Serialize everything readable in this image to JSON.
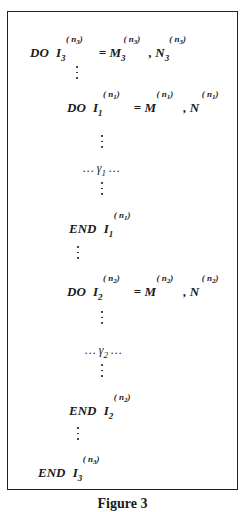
{
  "figure": {
    "caption": "Figure 3",
    "lines": [
      {
        "kind": "do",
        "indent": 0,
        "keyword": "DO",
        "var": "I",
        "var_sub": "3",
        "var_sup": "n",
        "var_sup_sub": "3",
        "eq": "=",
        "lo": "M",
        "lo_sub": "3",
        "lo_sup": "n",
        "lo_sup_sub": "3",
        "sep": ",",
        "hi": "N",
        "hi_sub": "3",
        "hi_sup": "n",
        "hi_sup_sub": "3"
      },
      {
        "kind": "vdots"
      },
      {
        "kind": "do",
        "indent": 1,
        "keyword": "DO",
        "var": "I",
        "var_sub": "1",
        "var_sup": "n",
        "var_sup_sub": "1",
        "eq": "=",
        "lo": "M",
        "lo_sup": "n",
        "lo_sup_sub": "1",
        "sep": ",",
        "hi": "N",
        "hi_sup": "n",
        "hi_sup_sub": "1"
      },
      {
        "kind": "vdots"
      },
      {
        "kind": "body",
        "text": "… γ",
        "sub": "1",
        "tail": " …"
      },
      {
        "kind": "vdots"
      },
      {
        "kind": "end",
        "keyword": "END",
        "var": "I",
        "var_sub": "1",
        "var_sup": "n",
        "var_sup_sub": "1"
      },
      {
        "kind": "vdots"
      },
      {
        "kind": "do",
        "indent": 1,
        "keyword": "DO",
        "var": "I",
        "var_sub": "2",
        "var_sup": "n",
        "var_sup_sub": "2",
        "eq": "=",
        "lo": "M",
        "lo_sup": "n",
        "lo_sup_sub": "2",
        "sep": ",",
        "hi": "N",
        "hi_sup": "n",
        "hi_sup_sub": "2"
      },
      {
        "kind": "vdots"
      },
      {
        "kind": "body",
        "text": "… γ",
        "sub": "2",
        "tail": " …"
      },
      {
        "kind": "vdots"
      },
      {
        "kind": "end",
        "keyword": "END",
        "var": "I",
        "var_sub": "2",
        "var_sup": "n",
        "var_sup_sub": "2"
      },
      {
        "kind": "vdots"
      },
      {
        "kind": "end",
        "keyword": "END",
        "var": "I",
        "var_sub": "3",
        "var_sup": "n",
        "var_sup_sub": "3"
      }
    ]
  },
  "text": {
    "do": "DO",
    "end": "END",
    "I": "I",
    "M": "M",
    "N": "N",
    "eq": "=",
    "comma": ",",
    "n": "n",
    "one": "1",
    "two": "2",
    "three": "3",
    "lp": "(",
    "rp": ")",
    "gamma": "γ",
    "ell": "…"
  }
}
